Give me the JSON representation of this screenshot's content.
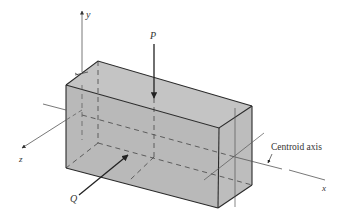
{
  "diagram": {
    "type": "3d-beam-isometric",
    "colors": {
      "background": "#ffffff",
      "face_front": "#b9b9b9",
      "face_top": "#c4c4c4",
      "face_right": "#bdbdbd",
      "edge": "#2a2a2a",
      "axis": "#555555",
      "dashed": "#444444"
    },
    "labels": {
      "y_axis": "y",
      "z_axis": "z",
      "x_axis": "x",
      "load_p": "P",
      "load_q": "Q",
      "centroid_axis": "Centroid axis"
    }
  }
}
